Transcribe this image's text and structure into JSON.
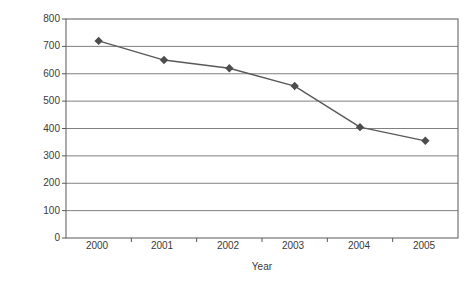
{
  "chart_data": {
    "type": "line",
    "title": "",
    "subtitle": "",
    "xlabel": "Year",
    "ylabel": "Share price",
    "categories": [
      "2000",
      "2001",
      "2002",
      "2003",
      "2004",
      "2005"
    ],
    "values": [
      720,
      650,
      620,
      555,
      405,
      355
    ],
    "series": [
      {
        "name": "Share price",
        "values": [
          720,
          650,
          620,
          555,
          405,
          355
        ]
      }
    ],
    "ylim": [
      0,
      800
    ],
    "yticks": [
      0,
      100,
      200,
      300,
      400,
      500,
      600,
      700,
      800
    ],
    "ytick_labels": [
      "0",
      "100",
      "200",
      "300",
      "400",
      "500",
      "600",
      "700",
      "800"
    ],
    "grid": true,
    "grid_axis": "y",
    "legend": false,
    "legend_position": "none",
    "marker": "diamond",
    "annotations": []
  },
  "style": {
    "line_color": "#595959",
    "marker_color": "#4d4d4d",
    "grid_color": "#808080",
    "axis_color": "#595959",
    "text_color": "#3a3a3a",
    "background": "#ffffff"
  }
}
